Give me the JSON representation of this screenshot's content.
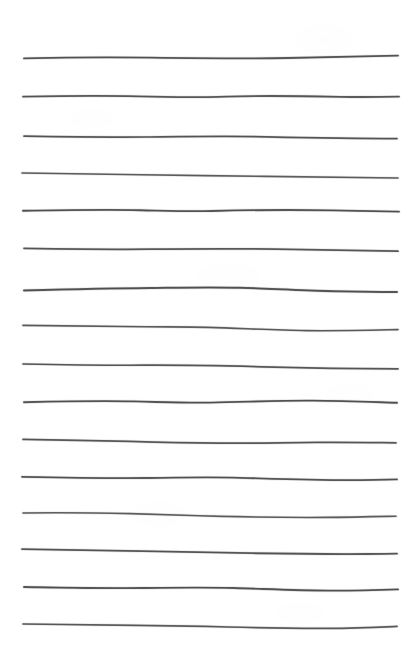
{
  "document": {
    "kind": "scanned-ruled-paper",
    "title": "Ruled notepad page",
    "page_width": 416,
    "page_height": 659,
    "background_color": "#ffffff",
    "ink_color": "#4a4a4a",
    "ink_color_dark": "#3a3a3a",
    "ink_color_light": "#8d8d8d",
    "line_count": 16,
    "left_margin": 22,
    "right_margin": 16,
    "line_spacing": 38,
    "first_line_y": 57,
    "last_line_y": 625,
    "stroke_width_min": 1.0,
    "stroke_width_max": 2.1,
    "content_text": "",
    "annotations": []
  },
  "rules": [
    {
      "index": 1,
      "y": 57,
      "x_start": 24,
      "x_end": 398,
      "stroke_width": 1.8,
      "opacity": 0.86,
      "color": "#4a4a4a",
      "path": "M24,58.4 C62,57.4 104,57.0 150,57.6 C196,58.2 242,58.8 288,58.0 C320,57.4 360,56.3 398,55.6"
    },
    {
      "index": 2,
      "y": 96,
      "x_start": 23,
      "x_end": 399,
      "stroke_width": 1.8,
      "opacity": 0.84,
      "color": "#4a4a4a",
      "path": "M23,96.6 C60,96.0 98,95.4 138,96.4 C170,97.2 196,97.6 226,96.6 C262,95.4 300,96.0 340,96.8 C362,97.2 380,97.0 399,96.6"
    },
    {
      "index": 3,
      "y": 137,
      "x_start": 24,
      "x_end": 397,
      "stroke_width": 1.7,
      "opacity": 0.85,
      "color": "#4a4a4a",
      "path": "M24,136.2 C64,136.8 104,137.4 146,137.0 C186,136.6 226,136.0 266,136.8 C306,137.6 348,138.4 397,138.6"
    },
    {
      "index": 4,
      "y": 174,
      "x_start": 22,
      "x_end": 398,
      "stroke_width": 1.6,
      "opacity": 0.8,
      "color": "#4a4a4a",
      "path": "M22,173.0 C60,173.4 98,174.2 142,174.8 C184,175.4 224,175.8 266,176.4 C310,177.0 354,177.6 398,178.0"
    },
    {
      "index": 5,
      "y": 211,
      "x_start": 23,
      "x_end": 399,
      "stroke_width": 1.9,
      "opacity": 0.86,
      "color": "#4a4a4a",
      "path": "M23,210.8 C60,210.2 100,209.4 140,210.2 C168,210.8 188,211.6 212,211.0 C250,210.0 290,209.6 332,210.4 C360,211.0 380,211.4 399,211.6"
    },
    {
      "index": 6,
      "y": 249,
      "x_start": 24,
      "x_end": 398,
      "stroke_width": 1.7,
      "opacity": 0.84,
      "color": "#4a4a4a",
      "path": "M24,248.4 C66,249.0 108,249.6 150,249.2 C192,248.8 234,248.4 276,249.2 C318,250.0 358,250.8 398,251.2"
    },
    {
      "index": 7,
      "y": 289,
      "x_start": 24,
      "x_end": 397,
      "stroke_width": 2.0,
      "opacity": 0.86,
      "color": "#4a4a4a",
      "path": "M24,290.4 C64,289.4 106,288.4 150,288.0 C184,287.6 212,287.0 240,287.8 C272,288.8 300,290.4 334,291.2 C360,291.8 380,292.0 397,292.0"
    },
    {
      "index": 8,
      "y": 326,
      "x_start": 23,
      "x_end": 398,
      "stroke_width": 1.6,
      "opacity": 0.82,
      "color": "#4a4a4a",
      "path": "M23,325.4 C62,325.8 102,326.4 146,326.8 C172,327.0 188,326.8 208,327.4 C246,328.6 276,330.2 306,330.6 C340,331.0 370,330.2 398,329.6"
    },
    {
      "index": 9,
      "y": 365,
      "x_start": 23,
      "x_end": 398,
      "stroke_width": 1.7,
      "opacity": 0.84,
      "color": "#4a4a4a",
      "path": "M23,364.0 C62,364.8 102,365.4 144,365.2 C186,365.0 224,365.8 262,366.8 C302,367.8 344,368.6 398,368.8"
    },
    {
      "index": 10,
      "y": 402,
      "x_start": 24,
      "x_end": 397,
      "stroke_width": 1.9,
      "opacity": 0.86,
      "color": "#4a4a4a",
      "path": "M24,402.2 C60,401.4 96,400.6 134,401.4 C162,402.0 184,403.0 210,402.6 C246,402.0 278,400.4 312,400.6 C344,400.8 372,402.0 397,402.8"
    },
    {
      "index": 11,
      "y": 440,
      "x_start": 23,
      "x_end": 396,
      "stroke_width": 1.7,
      "opacity": 0.84,
      "color": "#4a4a4a",
      "path": "M23,439.4 C58,439.8 94,440.4 130,441.4 C162,442.4 190,443.0 220,443.2 C254,443.4 282,442.6 316,442.4 C348,442.2 374,442.6 396,442.8"
    },
    {
      "index": 12,
      "y": 478,
      "x_start": 22,
      "x_end": 397,
      "stroke_width": 1.8,
      "opacity": 0.85,
      "color": "#4a4a4a",
      "path": "M22,476.8 C62,477.6 104,478.4 146,478.0 C180,477.6 210,477.0 240,477.8 C276,478.8 312,480.0 348,480.2 C370,480.2 386,479.8 397,479.4"
    },
    {
      "index": 13,
      "y": 514,
      "x_start": 23,
      "x_end": 396,
      "stroke_width": 1.6,
      "opacity": 0.8,
      "color": "#4a4a4a",
      "path": "M23,513.0 C58,512.4 94,512.8 130,513.6 C164,514.4 192,515.6 222,516.4 C256,517.2 292,517.6 326,517.4 C356,517.2 378,516.6 396,516.2"
    },
    {
      "index": 14,
      "y": 550,
      "x_start": 22,
      "x_end": 397,
      "stroke_width": 1.8,
      "opacity": 0.84,
      "color": "#4a4a4a",
      "path": "M22,549.2 C60,549.8 100,550.6 142,551.2 C180,551.8 216,552.6 252,553.2 C290,553.8 330,554.2 366,554.0 C382,553.9 390,553.8 397,553.6"
    },
    {
      "index": 15,
      "y": 588,
      "x_start": 24,
      "x_end": 398,
      "stroke_width": 1.9,
      "opacity": 0.86,
      "color": "#4a4a4a",
      "path": "M24,587.0 C62,587.6 102,588.4 142,588.0 C176,587.6 204,587.2 234,588.0 C268,589.0 298,590.4 330,590.6 C356,590.8 380,590.0 398,589.4"
    },
    {
      "index": 16,
      "y": 625,
      "x_start": 23,
      "x_end": 397,
      "stroke_width": 1.7,
      "opacity": 0.82,
      "color": "#4a4a4a",
      "path": "M23,624.0 C58,624.4 96,625.0 136,625.4 C170,625.8 198,626.2 228,627.0 C262,627.9 296,628.6 328,628.4 C356,628.2 378,627.2 397,626.4"
    }
  ]
}
